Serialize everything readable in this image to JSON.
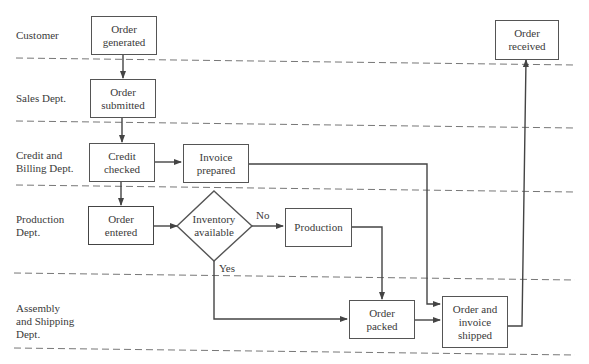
{
  "diagram": {
    "type": "swimlane-flowchart",
    "lanes": [
      {
        "id": "customer",
        "label": "Customer"
      },
      {
        "id": "sales",
        "label": "Sales Dept."
      },
      {
        "id": "credit",
        "label": "Credit and\nBilling Dept."
      },
      {
        "id": "production",
        "label": "Production\nDept."
      },
      {
        "id": "assembly",
        "label": "Assembly\nand Shipping\nDept."
      }
    ],
    "nodes": {
      "order_generated": "Order\ngenerated",
      "order_submitted": "Order\nsubmitted",
      "credit_checked": "Credit\nchecked",
      "invoice_prepared": "Invoice\nprepared",
      "order_entered": "Order\nentered",
      "inventory_available": "Inventory\navailable",
      "production": "Production",
      "order_packed": "Order\npacked",
      "order_invoice_shipped": "Order and\ninvoice\nshipped",
      "order_received": "Order\nreceived"
    },
    "edge_labels": {
      "no": "No",
      "yes": "Yes"
    },
    "edges": [
      {
        "from": "order_generated",
        "to": "order_submitted"
      },
      {
        "from": "order_submitted",
        "to": "credit_checked"
      },
      {
        "from": "credit_checked",
        "to": "invoice_prepared"
      },
      {
        "from": "credit_checked",
        "to": "order_entered"
      },
      {
        "from": "order_entered",
        "to": "inventory_available"
      },
      {
        "from": "inventory_available",
        "to": "production",
        "label": "No"
      },
      {
        "from": "inventory_available",
        "to": "order_packed",
        "label": "Yes"
      },
      {
        "from": "production",
        "to": "order_packed"
      },
      {
        "from": "invoice_prepared",
        "to": "order_invoice_shipped"
      },
      {
        "from": "order_packed",
        "to": "order_invoice_shipped"
      },
      {
        "from": "order_invoice_shipped",
        "to": "order_received"
      }
    ],
    "colors": {
      "stroke": "#555555",
      "text": "#3a3a3a",
      "dash": "#777777"
    }
  }
}
